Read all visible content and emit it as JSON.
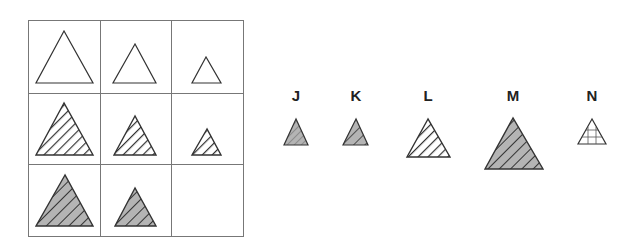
{
  "puzzle": {
    "grid": {
      "rows": 3,
      "cols": 3,
      "cells": [
        {
          "row": 0,
          "col": 0,
          "size": "large",
          "fill": "none"
        },
        {
          "row": 0,
          "col": 1,
          "size": "medium",
          "fill": "none"
        },
        {
          "row": 0,
          "col": 2,
          "size": "small",
          "fill": "none"
        },
        {
          "row": 1,
          "col": 0,
          "size": "large",
          "fill": "hatched-white"
        },
        {
          "row": 1,
          "col": 1,
          "size": "medium",
          "fill": "hatched-white"
        },
        {
          "row": 1,
          "col": 2,
          "size": "small",
          "fill": "hatched-white"
        },
        {
          "row": 2,
          "col": 0,
          "size": "large",
          "fill": "hatched-gray"
        },
        {
          "row": 2,
          "col": 1,
          "size": "medium",
          "fill": "hatched-gray"
        },
        {
          "row": 2,
          "col": 2,
          "size": "missing",
          "fill": "empty"
        }
      ]
    },
    "options": [
      {
        "label": "J",
        "size": "small-medium",
        "fill": "gray-fine-hatch"
      },
      {
        "label": "K",
        "size": "small-medium",
        "fill": "gray-coarse-hatch"
      },
      {
        "label": "L",
        "size": "medium",
        "fill": "hatched-white"
      },
      {
        "label": "M",
        "size": "large",
        "fill": "hatched-gray"
      },
      {
        "label": "N",
        "size": "small",
        "fill": "grid-lines"
      }
    ]
  },
  "colors": {
    "line": "#333333",
    "grid": "#777777",
    "gray_fill": "#b4b4b4",
    "white": "#ffffff"
  }
}
